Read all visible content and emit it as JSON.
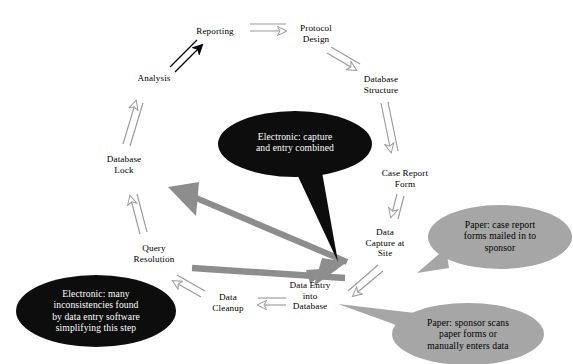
{
  "diagram": {
    "background_color": "#ffffff",
    "colors": {
      "node_text": "#000000",
      "outline_arrow": "#9a9a9a",
      "black_arrow": "#000000",
      "solid_gray_arrow": "#8d8d8d",
      "callout_dark_fill": "#0d0d0d",
      "callout_dark_text": "#ffffff",
      "callout_gray_fill": "#a6a6a6",
      "callout_gray_text": "#000000"
    }
  },
  "nodes": [
    {
      "id": "reporting",
      "label": "Reporting",
      "x": 215,
      "y": 31
    },
    {
      "id": "protocol-design",
      "label": "Protocol\nDesign",
      "x": 316,
      "y": 33
    },
    {
      "id": "database-structure",
      "label": "Database\nStructure",
      "x": 381,
      "y": 84
    },
    {
      "id": "case-report-form",
      "label": "Case Report\nForm",
      "x": 405,
      "y": 178
    },
    {
      "id": "data-capture-at-site",
      "label": "Data\nCapture at\nSite",
      "x": 385,
      "y": 243
    },
    {
      "id": "data-entry-into-database",
      "label": "Data Entry\ninto\nDatabase",
      "x": 310,
      "y": 296
    },
    {
      "id": "data-cleanup",
      "label": "Data\nCleanup",
      "x": 228,
      "y": 302
    },
    {
      "id": "query-resolution",
      "label": "Query\nResolution",
      "x": 154,
      "y": 253
    },
    {
      "id": "database-lock",
      "label": "Database\nLock",
      "x": 124,
      "y": 164
    },
    {
      "id": "analysis",
      "label": "Analysis",
      "x": 154,
      "y": 78
    }
  ],
  "callouts": [
    {
      "id": "electronic-capture-entry",
      "style": "dark",
      "text": "Electronic: capture\nand entry combined",
      "cx": 295,
      "cy": 144,
      "rx": 77,
      "ry": 33,
      "text_x": 295,
      "text_y": 142,
      "tail": "M 296,172 L 322,172 L 338,262 Z"
    },
    {
      "id": "electronic-inconsistencies",
      "style": "dark",
      "text": "Electronic: many\ninconsistencies found\nby data entry software\nsimplifying this step",
      "cx": 96,
      "cy": 311,
      "rx": 80,
      "ry": 36,
      "text_x": 96,
      "text_y": 311,
      "tail": "M 128,281 L 157,300 L 100,283 Z"
    },
    {
      "id": "paper-forms-mailed",
      "style": "gray",
      "text": "Paper: case report\nforms mailed in to\nsponsor",
      "cx": 500,
      "cy": 237,
      "rx": 72,
      "ry": 32,
      "text_x": 500,
      "text_y": 236,
      "tail": "M 440,252 L 418,272 L 443,266 Z"
    },
    {
      "id": "paper-sponsor-scans",
      "style": "gray",
      "text": "Paper: sponsor scans\npaper forms or\nmanually enters data",
      "cx": 468,
      "cy": 334,
      "rx": 76,
      "ry": 31,
      "text_x": 468,
      "text_y": 334,
      "tail": "M 412,310 L 340,305 L 405,327 Z"
    }
  ],
  "arrows": [
    {
      "id": "analysis-to-reporting",
      "style": "black-outline",
      "from": "analysis",
      "to": "reporting"
    },
    {
      "id": "reporting-to-protocol-design",
      "style": "gray-outline",
      "from": "reporting",
      "to": "protocol-design"
    },
    {
      "id": "protocol-design-to-database-structure",
      "style": "gray-outline",
      "from": "protocol-design",
      "to": "database-structure"
    },
    {
      "id": "database-structure-to-case-report-form",
      "style": "gray-outline",
      "from": "database-structure",
      "to": "case-report-form"
    },
    {
      "id": "case-report-form-to-data-capture",
      "style": "gray-outline",
      "from": "case-report-form",
      "to": "data-capture-at-site"
    },
    {
      "id": "data-capture-to-data-entry",
      "style": "gray-outline",
      "from": "data-capture-at-site",
      "to": "data-entry-into-database"
    },
    {
      "id": "data-entry-to-data-cleanup",
      "style": "gray-outline",
      "from": "data-entry-into-database",
      "to": "data-cleanup"
    },
    {
      "id": "data-cleanup-to-query-resolution",
      "style": "gray-outline",
      "from": "data-cleanup",
      "to": "query-resolution"
    },
    {
      "id": "query-resolution-to-database-lock",
      "style": "gray-outline",
      "from": "query-resolution",
      "to": "database-lock"
    },
    {
      "id": "database-lock-to-analysis",
      "style": "gray-outline",
      "from": "database-lock",
      "to": "analysis"
    },
    {
      "id": "data-entry-to-database-lock-shortcut",
      "style": "gray-solid",
      "from": "data-entry-into-database",
      "to": "database-lock"
    },
    {
      "id": "data-entry-to-query-resolution-shortcut",
      "style": "gray-solid",
      "from": "data-entry-into-database",
      "to": "query-resolution"
    }
  ]
}
